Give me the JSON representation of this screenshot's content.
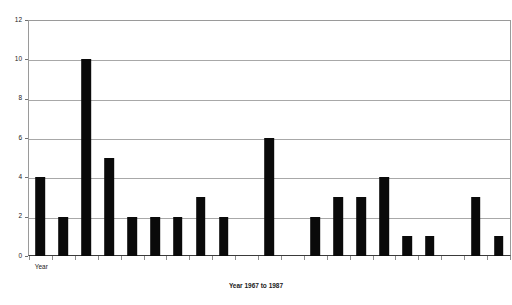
{
  "chart_data": {
    "type": "bar",
    "title": "",
    "subtitle": "",
    "xlabel": "Year 1967 to 1987",
    "ylabel": "",
    "categories": [
      "1967",
      "1968",
      "1969",
      "1970",
      "1971",
      "1972",
      "1973",
      "1974",
      "1975",
      "1976",
      "1977",
      "1978",
      "1979",
      "1980",
      "1981",
      "1982",
      "1983",
      "1984",
      "1985",
      "1986",
      "1987"
    ],
    "values": [
      4,
      2,
      10,
      5,
      2,
      2,
      2,
      3,
      2,
      0,
      6,
      0,
      2,
      3,
      3,
      4,
      1,
      1,
      0,
      3,
      1
    ],
    "ylim": [
      0,
      12
    ],
    "xlim": [
      0,
      21
    ],
    "y_ticks": [
      0,
      2,
      4,
      6,
      8,
      10,
      12
    ],
    "y_tick_labels": [
      "0",
      "2",
      "4",
      "6",
      "8",
      "10",
      "12"
    ],
    "grid": true,
    "grid_axis": "y",
    "legend": false,
    "legend_position": "none",
    "bar_color": "#0a0a0a",
    "grid_color": "#a8a8a8",
    "axis_color": "#3a3a3a",
    "annotations": []
  },
  "axes": {
    "x_axis": {
      "title": "Year 1967 to 1987",
      "category_label": "Year",
      "tick_count": 21
    },
    "y_axis": {
      "min_label": "0",
      "max_label": "12",
      "labels": [
        "0",
        "2",
        "4",
        "6",
        "8",
        "10",
        "12"
      ]
    }
  },
  "meta": {
    "background_color": "#ffffff",
    "plot_background_color": "#ffffff"
  }
}
